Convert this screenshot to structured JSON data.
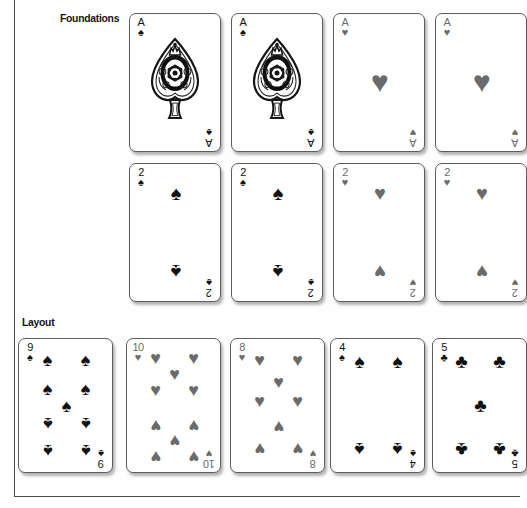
{
  "page": {
    "background_color": "#fefefe",
    "rule_color": "#4a4a4a",
    "black_suit_color": "#111111",
    "red_suit_color_printed_gray": "#6b6b6b"
  },
  "sections": [
    {
      "id": "foundations",
      "label": "Foundations"
    },
    {
      "id": "layout",
      "label": "Layout"
    }
  ],
  "suit_glyphs": {
    "spade": "♠",
    "heart": "♥",
    "club": "♣",
    "diamond": "♦"
  },
  "foundations": {
    "row1": [
      {
        "rank": "A",
        "suit": "spade",
        "suit_glyph": "♠",
        "color": "black",
        "ornate": true
      },
      {
        "rank": "A",
        "suit": "spade",
        "suit_glyph": "♠",
        "color": "black",
        "ornate": true
      },
      {
        "rank": "A",
        "suit": "heart",
        "suit_glyph": "♥",
        "color": "gray",
        "ornate": false
      },
      {
        "rank": "A",
        "suit": "heart",
        "suit_glyph": "♥",
        "color": "gray",
        "ornate": false
      }
    ],
    "row2": [
      {
        "rank": "2",
        "suit": "spade",
        "suit_glyph": "♠",
        "color": "black"
      },
      {
        "rank": "2",
        "suit": "spade",
        "suit_glyph": "♠",
        "color": "black"
      },
      {
        "rank": "2",
        "suit": "heart",
        "suit_glyph": "♥",
        "color": "gray"
      },
      {
        "rank": "2",
        "suit": "heart",
        "suit_glyph": "♥",
        "color": "gray"
      }
    ]
  },
  "layout": {
    "cards": [
      {
        "rank": "9",
        "suit": "spade",
        "suit_glyph": "♠",
        "color": "black"
      },
      {
        "rank": "10",
        "suit": "heart",
        "suit_glyph": "♥",
        "color": "gray"
      },
      {
        "rank": "8",
        "suit": "heart",
        "suit_glyph": "♥",
        "color": "gray"
      },
      {
        "rank": "4",
        "suit": "spade",
        "suit_glyph": "♠",
        "color": "black"
      },
      {
        "rank": "5",
        "suit": "club",
        "suit_glyph": "♣",
        "color": "black"
      }
    ]
  }
}
